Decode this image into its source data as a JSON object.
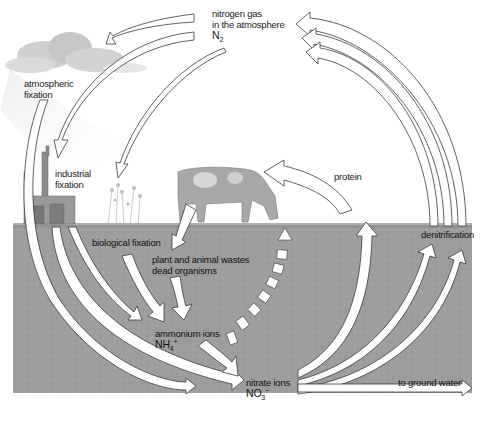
{
  "diagram": {
    "colors": {
      "sky": "#ffffff",
      "soil": "#9c9c9c",
      "soil_dark": "#8a8a8a",
      "arrow_fill": "#ffffff",
      "arrow_stroke": "#3a3a3a",
      "cloud": "#c9c9c9",
      "text": "#1a1a1a"
    },
    "labels": {
      "nitrogen_gas": [
        "nitrogen gas",
        "in the atmosphere"
      ],
      "n2": {
        "base": "N",
        "sub": "2"
      },
      "atmospheric_fixation": [
        "atmospheric",
        "fixation"
      ],
      "industrial_fixation": [
        "industrial",
        "fixation"
      ],
      "protein": "protein",
      "biological_fixation": "biological fixation",
      "wastes": [
        "plant and animal wastes",
        "dead organisms"
      ],
      "ammonium": "ammonium ions",
      "nh4": {
        "base": "NH",
        "sub": "4",
        "sup": "+"
      },
      "nitrate": "nitrate ions",
      "no3": {
        "base": "NO",
        "sub": "3",
        "sup": "−"
      },
      "denitrification": "denitrification",
      "ground_water": "to ground water"
    },
    "nodes": [
      {
        "id": "n2_atmosphere",
        "label": "nitrogen gas in the atmosphere N2"
      },
      {
        "id": "atmospheric_fixation",
        "label": "atmospheric fixation"
      },
      {
        "id": "industrial_fixation",
        "label": "industrial fixation"
      },
      {
        "id": "biological_fixation",
        "label": "biological fixation"
      },
      {
        "id": "wastes",
        "label": "plant and animal wastes dead organisms"
      },
      {
        "id": "ammonium",
        "label": "ammonium ions NH4+"
      },
      {
        "id": "nitrate",
        "label": "nitrate ions NO3−"
      },
      {
        "id": "protein",
        "label": "protein"
      },
      {
        "id": "denitrification",
        "label": "denitrification"
      },
      {
        "id": "ground_water",
        "label": "to ground water"
      }
    ],
    "edges": [
      {
        "from": "n2_atmosphere",
        "to": "atmospheric_fixation"
      },
      {
        "from": "n2_atmosphere",
        "to": "industrial_fixation"
      },
      {
        "from": "n2_atmosphere",
        "to": "biological_fixation"
      },
      {
        "from": "atmospheric_fixation",
        "to": "nitrate"
      },
      {
        "from": "industrial_fixation",
        "to": "nitrate"
      },
      {
        "from": "industrial_fixation",
        "to": "ammonium"
      },
      {
        "from": "biological_fixation",
        "to": "ammonium"
      },
      {
        "from": "wastes",
        "to": "ammonium"
      },
      {
        "from": "ammonium",
        "to": "nitrate"
      },
      {
        "from": "ammonium",
        "to": "protein",
        "style": "dashed"
      },
      {
        "from": "protein",
        "to": "wastes"
      },
      {
        "from": "nitrate",
        "to": "protein"
      },
      {
        "from": "nitrate",
        "to": "denitrification"
      },
      {
        "from": "denitrification",
        "to": "n2_atmosphere"
      },
      {
        "from": "nitrate",
        "to": "ground_water"
      }
    ],
    "illustrations": [
      "cloud-with-rain",
      "industrial-plant",
      "flowering-plants",
      "grazing-cow"
    ]
  }
}
